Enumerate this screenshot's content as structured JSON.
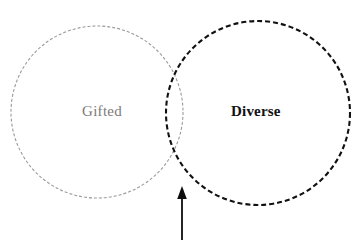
{
  "diagram": {
    "type": "venn-2-set",
    "background_color": "#ffffff",
    "width": 361,
    "height": 245,
    "sets": [
      {
        "id": "gifted",
        "label": "Gifted",
        "stroke_color": "#9a9a9a",
        "text_color": "#7c7a78",
        "stroke_style": "dashed",
        "stroke_width": 1.1,
        "dash_pattern": "3,2",
        "center_x": 97,
        "center_y": 112,
        "radius": 86,
        "font_weight": "normal"
      },
      {
        "id": "diverse",
        "label": "Diverse",
        "stroke_color": "#111111",
        "text_color": "#121212",
        "stroke_style": "dashed",
        "stroke_width": 2.1,
        "dash_pattern": "5,3",
        "center_x": 258,
        "center_y": 113,
        "radius": 92,
        "font_weight": "bold"
      }
    ],
    "annotations": [
      {
        "id": "intersection-arrow",
        "shape": "arrow",
        "direction": "up",
        "color": "#0d0d0d",
        "x": 182,
        "tip_y": 186,
        "base_y": 240,
        "points_to": "intersection"
      }
    ]
  }
}
